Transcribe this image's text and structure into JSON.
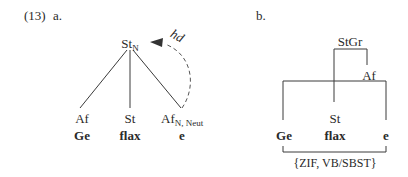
{
  "example_number": "(13)",
  "panel_a": {
    "label": "a.",
    "root": {
      "base": "St",
      "sub": "N"
    },
    "arrow_label": "hd",
    "leaves": [
      {
        "category": "Af",
        "category_sub": "",
        "form": "Ge"
      },
      {
        "category": "St",
        "category_sub": "",
        "form": "flax"
      },
      {
        "category": "Af",
        "category_sub": "N, Neut",
        "form": "e"
      }
    ]
  },
  "panel_b": {
    "label": "b.",
    "root": "StGr",
    "af_node": "Af",
    "st_node": "St",
    "forms": [
      "Ge",
      "flax",
      "e"
    ],
    "bracket_label": "{ZIF, VB/SBST}"
  }
}
